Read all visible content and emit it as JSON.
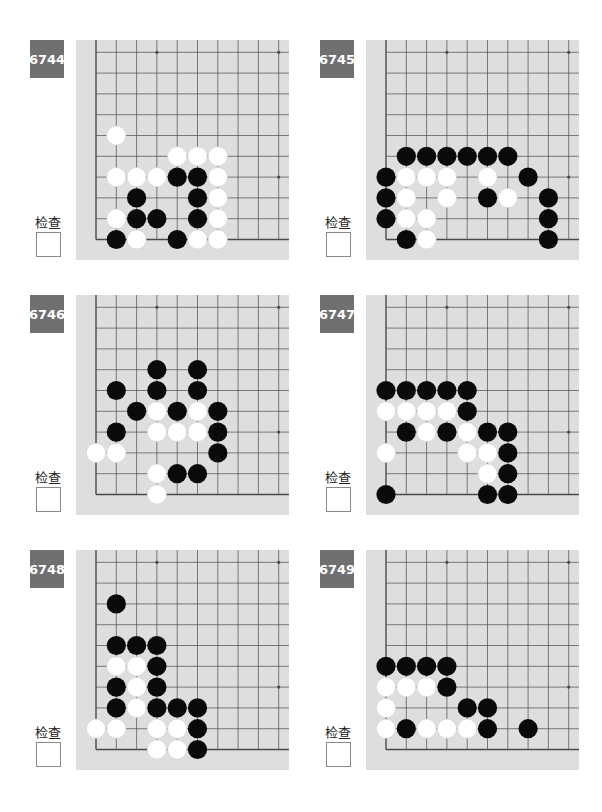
{
  "check_label": "检查",
  "colors": {
    "label_bg": "#707070",
    "board_bg": "#dedede",
    "grid_line": "#4a4a4a",
    "black_stone": "#0a0a0a",
    "white_stone": "#ffffff"
  },
  "board_geometry": {
    "cols": 10,
    "rows": 10,
    "spacing_x": 20.3,
    "spacing_y": 20.8,
    "origin_left": 20,
    "origin_bottom_from_top": 199.5,
    "star_points": [
      [
        3,
        3
      ],
      [
        9,
        3
      ],
      [
        3,
        9
      ],
      [
        9,
        9
      ]
    ],
    "edges": [
      "left",
      "bottom"
    ]
  },
  "problems": [
    {
      "number": "6744",
      "position": {
        "left": 30,
        "top": 40
      },
      "stones": {
        "black": [
          [
            4,
            3
          ],
          [
            5,
            3
          ],
          [
            2,
            2
          ],
          [
            5,
            2
          ],
          [
            2,
            1
          ],
          [
            3,
            1
          ],
          [
            5,
            1
          ],
          [
            1,
            0
          ],
          [
            4,
            0
          ]
        ],
        "white": [
          [
            1,
            5
          ],
          [
            4,
            4
          ],
          [
            5,
            4
          ],
          [
            6,
            4
          ],
          [
            1,
            3
          ],
          [
            2,
            3
          ],
          [
            3,
            3
          ],
          [
            6,
            3
          ],
          [
            6,
            2
          ],
          [
            1,
            1
          ],
          [
            6,
            1
          ],
          [
            2,
            0
          ],
          [
            5,
            0
          ],
          [
            6,
            0
          ]
        ]
      }
    },
    {
      "number": "6745",
      "position": {
        "left": 320,
        "top": 40
      },
      "stones": {
        "black": [
          [
            1,
            4
          ],
          [
            2,
            4
          ],
          [
            3,
            4
          ],
          [
            4,
            4
          ],
          [
            5,
            4
          ],
          [
            6,
            4
          ],
          [
            0,
            3
          ],
          [
            7,
            3
          ],
          [
            0,
            2
          ],
          [
            5,
            2
          ],
          [
            8,
            2
          ],
          [
            0,
            1
          ],
          [
            8,
            1
          ],
          [
            1,
            0
          ],
          [
            8,
            0
          ]
        ],
        "white": [
          [
            1,
            3
          ],
          [
            2,
            3
          ],
          [
            3,
            3
          ],
          [
            5,
            3
          ],
          [
            1,
            2
          ],
          [
            3,
            2
          ],
          [
            6,
            2
          ],
          [
            1,
            1
          ],
          [
            2,
            1
          ],
          [
            2,
            0
          ]
        ]
      }
    },
    {
      "number": "6746",
      "position": {
        "left": 30,
        "top": 295
      },
      "stones": {
        "black": [
          [
            3,
            6
          ],
          [
            5,
            6
          ],
          [
            1,
            5
          ],
          [
            3,
            5
          ],
          [
            5,
            5
          ],
          [
            2,
            4
          ],
          [
            4,
            4
          ],
          [
            6,
            4
          ],
          [
            1,
            3
          ],
          [
            6,
            3
          ],
          [
            6,
            2
          ],
          [
            4,
            1
          ],
          [
            5,
            1
          ]
        ],
        "white": [
          [
            3,
            4
          ],
          [
            5,
            4
          ],
          [
            3,
            3
          ],
          [
            4,
            3
          ],
          [
            5,
            3
          ],
          [
            0,
            2
          ],
          [
            1,
            2
          ],
          [
            3,
            1
          ],
          [
            3,
            0
          ]
        ]
      }
    },
    {
      "number": "6747",
      "position": {
        "left": 320,
        "top": 295
      },
      "stones": {
        "black": [
          [
            0,
            5
          ],
          [
            1,
            5
          ],
          [
            2,
            5
          ],
          [
            3,
            5
          ],
          [
            4,
            5
          ],
          [
            4,
            4
          ],
          [
            1,
            3
          ],
          [
            3,
            3
          ],
          [
            5,
            3
          ],
          [
            6,
            3
          ],
          [
            6,
            2
          ],
          [
            6,
            1
          ],
          [
            0,
            0
          ],
          [
            5,
            0
          ],
          [
            6,
            0
          ]
        ],
        "white": [
          [
            0,
            4
          ],
          [
            1,
            4
          ],
          [
            2,
            4
          ],
          [
            3,
            4
          ],
          [
            2,
            3
          ],
          [
            4,
            3
          ],
          [
            0,
            2
          ],
          [
            4,
            2
          ],
          [
            5,
            2
          ],
          [
            5,
            1
          ]
        ]
      }
    },
    {
      "number": "6748",
      "position": {
        "left": 30,
        "top": 550
      },
      "stones": {
        "black": [
          [
            1,
            7
          ],
          [
            1,
            5
          ],
          [
            2,
            5
          ],
          [
            3,
            5
          ],
          [
            3,
            4
          ],
          [
            1,
            3
          ],
          [
            3,
            3
          ],
          [
            1,
            2
          ],
          [
            3,
            2
          ],
          [
            4,
            2
          ],
          [
            5,
            2
          ],
          [
            5,
            1
          ],
          [
            5,
            0
          ]
        ],
        "white": [
          [
            1,
            4
          ],
          [
            2,
            4
          ],
          [
            2,
            3
          ],
          [
            2,
            2
          ],
          [
            0,
            1
          ],
          [
            1,
            1
          ],
          [
            3,
            1
          ],
          [
            4,
            1
          ],
          [
            3,
            0
          ],
          [
            4,
            0
          ]
        ]
      }
    },
    {
      "number": "6749",
      "position": {
        "left": 320,
        "top": 550
      },
      "stones": {
        "black": [
          [
            0,
            4
          ],
          [
            1,
            4
          ],
          [
            2,
            4
          ],
          [
            3,
            4
          ],
          [
            3,
            3
          ],
          [
            4,
            2
          ],
          [
            5,
            2
          ],
          [
            1,
            1
          ],
          [
            5,
            1
          ],
          [
            7,
            1
          ]
        ],
        "white": [
          [
            0,
            3
          ],
          [
            1,
            3
          ],
          [
            2,
            3
          ],
          [
            0,
            2
          ],
          [
            0,
            1
          ],
          [
            2,
            1
          ],
          [
            3,
            1
          ],
          [
            4,
            1
          ]
        ]
      }
    }
  ]
}
